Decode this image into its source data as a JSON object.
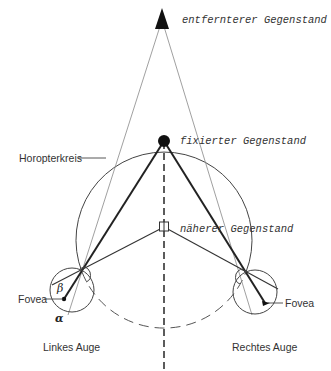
{
  "diagram": {
    "labels": {
      "distant_object": "entfernterer Gegenstand",
      "fixated_object": "fixierter Gegenstand",
      "nearer_object": "näherer Gegenstand",
      "horopter": "Horopterkreis",
      "fovea_left": "Fovea",
      "fovea_right": "Fovea",
      "left_eye": "Linkes Auge",
      "right_eye": "Rechtes Auge",
      "beta": "β",
      "alpha": "α"
    },
    "colors": {
      "line": "#333333",
      "thin_line": "#888888",
      "background": "#ffffff"
    }
  }
}
